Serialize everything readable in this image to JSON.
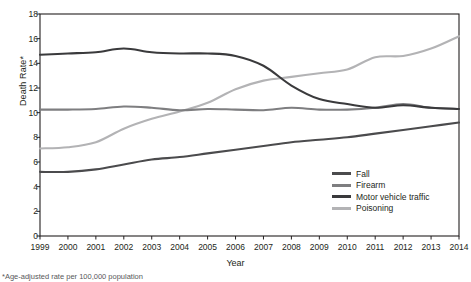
{
  "chart_data": {
    "type": "line",
    "title": "",
    "xlabel": "Year",
    "ylabel": "Death Rate*",
    "x": [
      1999,
      2000,
      2001,
      2002,
      2003,
      2004,
      2005,
      2006,
      2007,
      2008,
      2009,
      2010,
      2011,
      2012,
      2013,
      2014
    ],
    "xlim": [
      1999,
      2014
    ],
    "ylim": [
      0,
      18
    ],
    "yticks": [
      0,
      2,
      4,
      6,
      8,
      10,
      12,
      14,
      16,
      18
    ],
    "xticks": [
      "1999",
      "2000",
      "2001",
      "2002",
      "2003",
      "2004",
      "2005",
      "2006",
      "2007",
      "2008",
      "2009",
      "2010",
      "2011",
      "2012",
      "2013",
      "2014"
    ],
    "grid": false,
    "legend_position": "lower-right",
    "series": [
      {
        "name": "Fall",
        "color": "#4b4b4d",
        "values": [
          5.2,
          5.2,
          5.4,
          5.8,
          6.2,
          6.4,
          6.7,
          7.0,
          7.3,
          7.6,
          7.8,
          8.0,
          8.3,
          8.6,
          8.9,
          9.2
        ]
      },
      {
        "name": "Firearm",
        "color": "#7e7e80",
        "values": [
          10.25,
          10.25,
          10.3,
          10.5,
          10.4,
          10.2,
          10.3,
          10.25,
          10.2,
          10.4,
          10.25,
          10.25,
          10.4,
          10.7,
          10.4,
          10.3
        ]
      },
      {
        "name": "Motor vehicle traffic",
        "color": "#3a3a3c",
        "values": [
          14.7,
          14.8,
          14.9,
          15.2,
          14.9,
          14.8,
          14.8,
          14.6,
          13.8,
          12.2,
          11.1,
          10.7,
          10.4,
          10.6,
          10.4,
          10.3
        ]
      },
      {
        "name": "Poisoning",
        "color": "#b3b3b5",
        "values": [
          7.1,
          7.2,
          7.6,
          8.7,
          9.5,
          10.1,
          10.8,
          11.9,
          12.6,
          12.9,
          13.2,
          13.5,
          14.5,
          14.6,
          15.2,
          16.2
        ]
      }
    ]
  },
  "axis": {
    "y_title": "Death Rate*",
    "x_title": "Year"
  },
  "legend": {
    "items": [
      {
        "label": "Fall"
      },
      {
        "label": "Firearm"
      },
      {
        "label": "Motor vehicle traffic"
      },
      {
        "label": "Poisoning"
      }
    ]
  },
  "footnote": "*Age-adjusted rate per 100,000 population"
}
